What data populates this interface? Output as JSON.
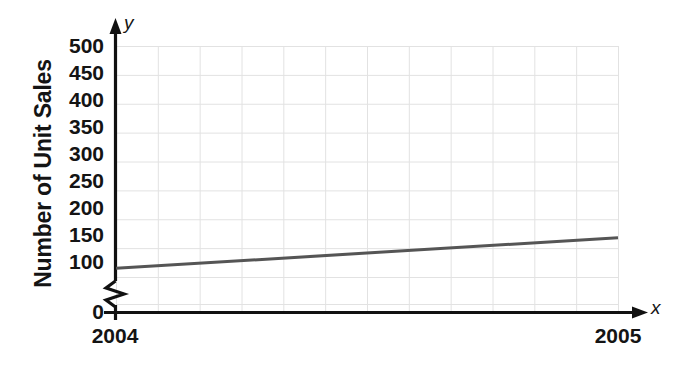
{
  "chart_data": {
    "type": "line",
    "title": "",
    "xlabel": "Year",
    "ylabel": "Number of Unit Sales",
    "x": [
      2004,
      2005
    ],
    "values": [
      115,
      168
    ],
    "series": [
      {
        "name": "Unit Sales",
        "values": [
          115,
          168
        ],
        "color": "#555555"
      }
    ],
    "xtick_labels": [
      "2004",
      "2005"
    ],
    "ytick_labels": [
      "0",
      "100",
      "150",
      "200",
      "250",
      "300",
      "350",
      "400",
      "450",
      "500"
    ],
    "ylim": [
      0,
      500
    ],
    "xlim": [
      2004,
      2005
    ],
    "y_axis_break": true,
    "y_axis_break_between": [
      0,
      100
    ],
    "grid": true,
    "grid_color": "#e2e2e2",
    "legend": "none",
    "axis_letters": {
      "x": "x",
      "y": "y"
    },
    "axis_color": "#111111",
    "background": "#ffffff"
  }
}
